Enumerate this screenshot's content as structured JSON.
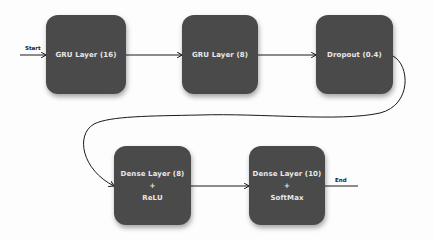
{
  "diagram": {
    "type": "flowchart",
    "direction": "left-to-right, wrapping",
    "colors": {
      "node_fill": "#4a4a4a",
      "node_text": "#e8e8e8",
      "edge": "#1a1a1a",
      "background": "#fdfdfd"
    },
    "start_label": "Start",
    "end_label": "End",
    "nodes": [
      {
        "id": "gru16",
        "lines": [
          "GRU Layer (16)"
        ]
      },
      {
        "id": "gru8",
        "lines": [
          "GRU Layer (8)"
        ]
      },
      {
        "id": "dropout",
        "lines": [
          "Dropout (0.4)"
        ]
      },
      {
        "id": "dense8",
        "lines": [
          "Dense Layer (8)",
          "+",
          "ReLU"
        ]
      },
      {
        "id": "dense10",
        "lines": [
          "Dense Layer (10)",
          "+",
          "SoftMax"
        ]
      }
    ],
    "edges": [
      {
        "from": "start",
        "to": "gru16"
      },
      {
        "from": "gru16",
        "to": "gru8"
      },
      {
        "from": "gru8",
        "to": "dropout"
      },
      {
        "from": "dropout",
        "to": "dense8"
      },
      {
        "from": "dense8",
        "to": "dense10"
      },
      {
        "from": "dense10",
        "to": "end"
      }
    ]
  }
}
